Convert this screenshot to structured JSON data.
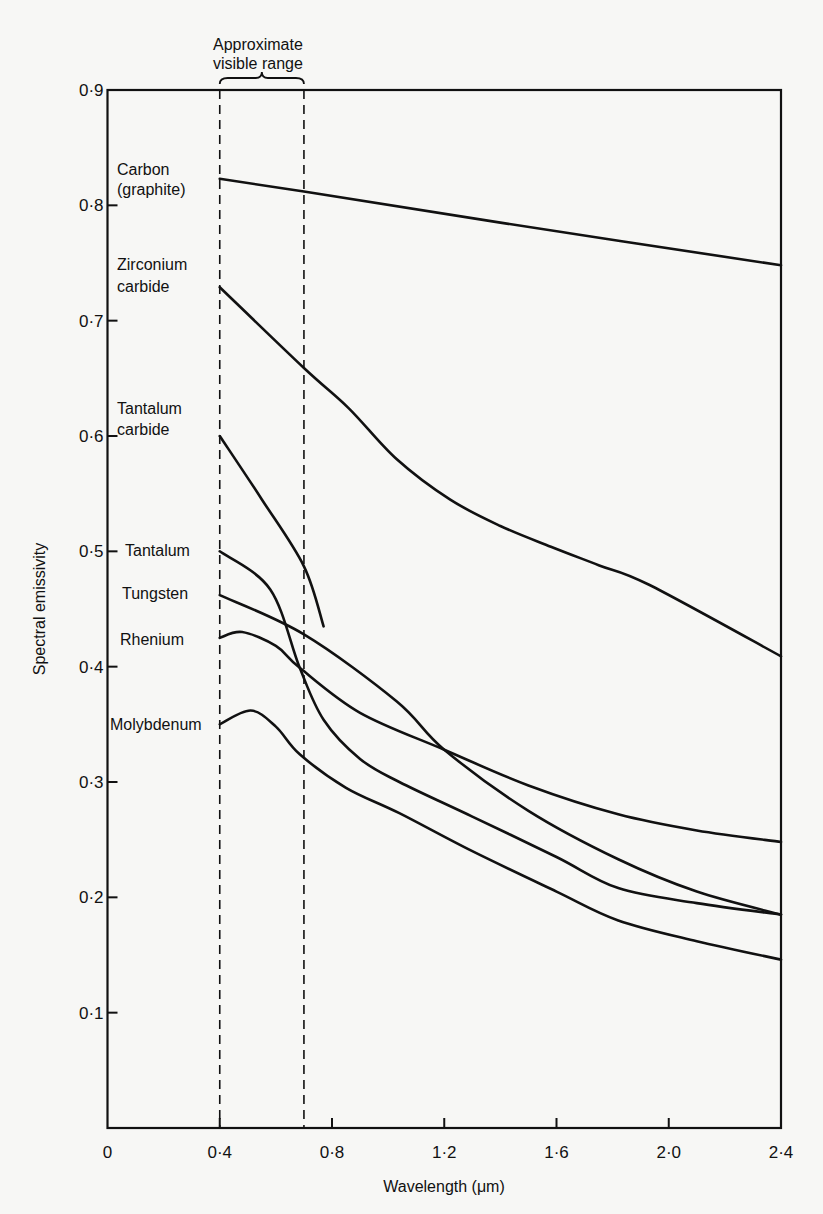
{
  "chart_data": {
    "type": "line",
    "title": "",
    "xlabel": "Wavelength (μm)",
    "ylabel": "Spectral emissivity",
    "xlim": [
      0,
      2.4
    ],
    "ylim": [
      0,
      0.9
    ],
    "grid": false,
    "x_ticks": [
      0,
      0.4,
      0.8,
      1.2,
      1.6,
      2.0,
      2.4
    ],
    "x_tick_labels": [
      "0",
      "0·4",
      "0·8",
      "1·2",
      "1·6",
      "2·0",
      "2·4"
    ],
    "y_ticks": [
      0.1,
      0.2,
      0.3,
      0.4,
      0.5,
      0.6,
      0.7,
      0.8,
      0.9
    ],
    "y_tick_labels": [
      "0·1",
      "0·2",
      "0·3",
      "0·4",
      "0·5",
      "0·6",
      "0·7",
      "0·8",
      "0·9"
    ],
    "annotation": {
      "text_line1": "Approximate",
      "text_line2": "visible range",
      "range": [
        0.4,
        0.7
      ]
    },
    "series": [
      {
        "name": "Carbon (graphite)",
        "label_lines": [
          "Carbon",
          "(graphite)"
        ],
        "x": [
          0.4,
          0.7,
          1.4,
          2.4
        ],
        "y": [
          0.823,
          0.812,
          0.785,
          0.748
        ]
      },
      {
        "name": "Zirconium carbide",
        "label_lines": [
          "Zirconium",
          "carbide"
        ],
        "x": [
          0.4,
          0.7,
          0.86,
          1.03,
          1.22,
          1.4,
          1.58,
          1.75,
          1.93,
          2.4
        ],
        "y": [
          0.729,
          0.659,
          0.624,
          0.58,
          0.545,
          0.522,
          0.504,
          0.488,
          0.471,
          0.409
        ]
      },
      {
        "name": "Tantalum carbide",
        "label_lines": [
          "Tantalum",
          "carbide"
        ],
        "x": [
          0.4,
          0.55,
          0.7,
          0.77
        ],
        "y": [
          0.6,
          0.545,
          0.487,
          0.435
        ]
      },
      {
        "name": "Tantalum",
        "label_lines": [
          "Tantalum"
        ],
        "x": [
          0.4,
          0.58,
          0.685,
          0.77,
          0.9,
          1.04,
          1.3,
          1.6,
          1.82,
          2.1,
          2.4
        ],
        "y": [
          0.5,
          0.467,
          0.399,
          0.354,
          0.32,
          0.3,
          0.27,
          0.235,
          0.208,
          0.195,
          0.185
        ]
      },
      {
        "name": "Tungsten",
        "label_lines": [
          "Tungsten"
        ],
        "x": [
          0.4,
          0.7,
          1.03,
          1.2,
          1.5,
          1.82,
          2.1,
          2.4
        ],
        "y": [
          0.462,
          0.428,
          0.37,
          0.328,
          0.275,
          0.233,
          0.205,
          0.185
        ]
      },
      {
        "name": "Rhenium",
        "label_lines": [
          "Rhenium"
        ],
        "x": [
          0.4,
          0.48,
          0.6,
          0.685,
          0.9,
          1.2,
          1.5,
          1.82,
          2.1,
          2.4
        ],
        "y": [
          0.425,
          0.43,
          0.418,
          0.399,
          0.36,
          0.328,
          0.297,
          0.272,
          0.258,
          0.248
        ]
      },
      {
        "name": "Molybdenum",
        "label_lines": [
          "Molybdenum"
        ],
        "x": [
          0.4,
          0.51,
          0.6,
          0.685,
          0.85,
          1.04,
          1.3,
          1.6,
          1.82,
          2.1,
          2.4
        ],
        "y": [
          0.35,
          0.362,
          0.348,
          0.324,
          0.295,
          0.273,
          0.24,
          0.205,
          0.18,
          0.162,
          0.146
        ]
      }
    ]
  }
}
